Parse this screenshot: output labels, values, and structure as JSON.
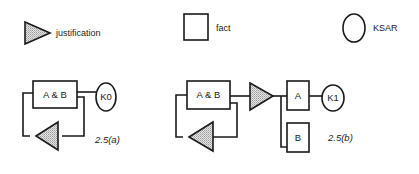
{
  "legend": {
    "justification": {
      "label": "justification",
      "icon": "triangle-stippled"
    },
    "fact": {
      "label": "fact",
      "icon": "square"
    },
    "ksar": {
      "label": "KSAR",
      "icon": "circle"
    }
  },
  "figure_a": {
    "caption": "2.5(a)",
    "fact_label": "A & B",
    "ksar_label": "K0"
  },
  "figure_b": {
    "caption": "2.5(b)",
    "fact_ab_label": "A & B",
    "fact_a_label": "A",
    "fact_b_label": "B",
    "ksar_label": "K1"
  },
  "colors": {
    "stroke": "#1a1a1a",
    "triangle_fill": "#cfcfcf",
    "background": "#ffffff"
  }
}
